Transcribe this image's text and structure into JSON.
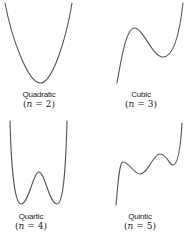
{
  "figure": {
    "panels": [
      {
        "name": "Quadratic",
        "degree_text": "(n = 2)",
        "degree_prefix": "(",
        "degree_var": "n",
        "degree_suffix": " = 2)",
        "shape": "parabola, one minimum"
      },
      {
        "name": "Cubic",
        "degree_text": "(n = 3)",
        "degree_prefix": "(",
        "degree_var": "n",
        "degree_suffix": " = 3)",
        "shape": "one local max, one local min"
      },
      {
        "name": "Quartic",
        "degree_text": "(n = 4)",
        "degree_prefix": "(",
        "degree_var": "n",
        "degree_suffix": " = 4)",
        "shape": "W shape, two minima, one local max"
      },
      {
        "name": "Quintic",
        "degree_text": "(n = 5)",
        "degree_prefix": "(",
        "degree_var": "n",
        "degree_suffix": " = 5)",
        "shape": "two local max, two local min"
      }
    ],
    "colors": {
      "curve": "#555555",
      "text": "#222222",
      "background": "#ffffff"
    }
  }
}
